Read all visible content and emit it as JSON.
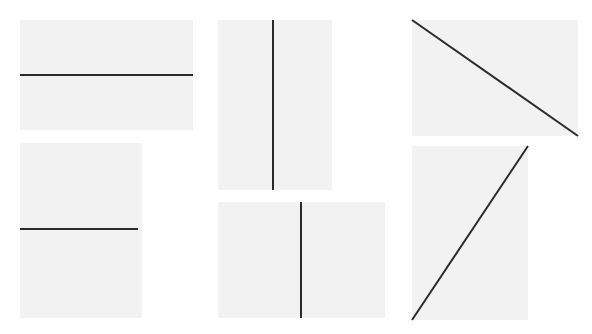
{
  "canvas": {
    "width": 592,
    "height": 334,
    "background_color": "#ffffff",
    "panel_color": "#f2f2f2",
    "line_color": "#2b2b2b",
    "line_width": 2
  },
  "panels": [
    {
      "id": "panel-top-left",
      "name": "horizontal-line-wide-panel",
      "orientation": "horizontal",
      "angle_deg": 0,
      "x": 20,
      "y": 20,
      "width": 173,
      "height": 110,
      "line": {
        "x1": 0,
        "y1": 55,
        "x2": 173,
        "y2": 55
      }
    },
    {
      "id": "panel-bottom-left",
      "name": "horizontal-line-narrow-panel",
      "orientation": "horizontal",
      "angle_deg": 0,
      "x": 20,
      "y": 143,
      "width": 122,
      "height": 175,
      "line": {
        "x1": 0,
        "y1": 86,
        "x2": 118,
        "y2": 86
      }
    },
    {
      "id": "panel-top-middle",
      "name": "vertical-line-tall-panel",
      "orientation": "vertical",
      "angle_deg": 90,
      "x": 218,
      "y": 20,
      "width": 114,
      "height": 170,
      "line": {
        "x1": 55,
        "y1": 0,
        "x2": 55,
        "y2": 170
      }
    },
    {
      "id": "panel-bottom-middle",
      "name": "vertical-line-short-panel",
      "orientation": "vertical",
      "angle_deg": 90,
      "x": 218,
      "y": 202,
      "width": 167,
      "height": 116,
      "line": {
        "x1": 83,
        "y1": 0,
        "x2": 83,
        "y2": 116
      }
    },
    {
      "id": "panel-top-right",
      "name": "diagonal-line-descending-panel",
      "orientation": "diagonal-descending",
      "angle_deg": -35,
      "x": 412,
      "y": 20,
      "width": 166,
      "height": 116,
      "line": {
        "x1": 0,
        "y1": 0,
        "x2": 166,
        "y2": 116
      }
    },
    {
      "id": "panel-bottom-right",
      "name": "diagonal-line-ascending-panel",
      "orientation": "diagonal-ascending",
      "angle_deg": 56,
      "x": 412,
      "y": 146,
      "width": 116,
      "height": 174,
      "line": {
        "x1": 0,
        "y1": 174,
        "x2": 116,
        "y2": 0
      }
    }
  ]
}
